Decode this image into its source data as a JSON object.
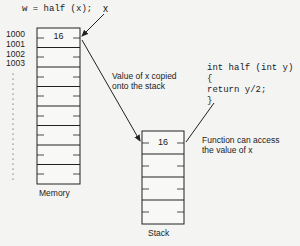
{
  "caller_code": "w = half (x);",
  "variable_label": "x",
  "memory": {
    "label": "Memory",
    "addresses": [
      "1000",
      "1001",
      "1002",
      "1003"
    ],
    "cells": [
      "16",
      "",
      "",
      "",
      "",
      "",
      "",
      ""
    ]
  },
  "copy_annotation": [
    "Value of x copied",
    "onto the stack"
  ],
  "function_code": [
    "int half (int y)",
    "{",
    "return y/2;",
    "}"
  ],
  "stack": {
    "label": "Stack",
    "cells": [
      "16",
      "",
      "",
      ""
    ]
  },
  "access_annotation": [
    "Function can access",
    "the value of x"
  ]
}
